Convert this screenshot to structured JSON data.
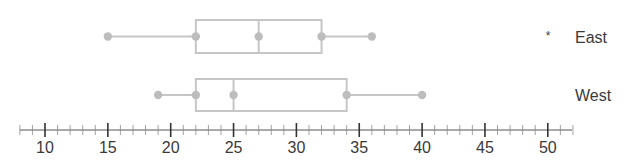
{
  "chart_data": {
    "type": "boxplot",
    "title": "",
    "xlabel": "",
    "ylabel": "",
    "xlim": [
      8,
      52
    ],
    "major_ticks": [
      10,
      15,
      20,
      25,
      30,
      35,
      40,
      45,
      50
    ],
    "minor_tick_step": 1,
    "tick_labels": [
      "10",
      "15",
      "20",
      "25",
      "30",
      "35",
      "40",
      "45",
      "50"
    ],
    "grid": false,
    "series": [
      {
        "name": "East",
        "marker": "*",
        "min": 15,
        "q1": 22,
        "median": 27,
        "q3": 32,
        "max": 36
      },
      {
        "name": "West",
        "marker": "",
        "min": 19,
        "q1": 22,
        "median": 25,
        "q3": 34,
        "max": 40
      }
    ],
    "colors": {
      "box": "#c6c6c6",
      "point": "#bdbdbd",
      "axis": "#555555",
      "text": "#3a3a3a"
    }
  }
}
